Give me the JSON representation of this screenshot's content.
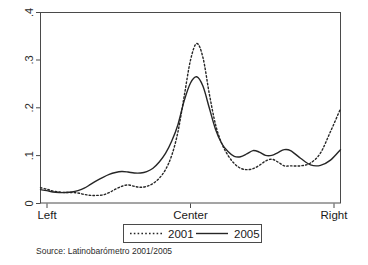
{
  "chart_data": {
    "type": "line",
    "title": "",
    "subtitle": "",
    "xlabel": "",
    "ylabel": "",
    "xlim": [
      0,
      10
    ],
    "ylim": [
      0,
      0.4
    ],
    "grid": false,
    "legend_position": "below-axis",
    "x_tick_labels": [
      "Left",
      "Center",
      "Right"
    ],
    "x_tick_values": [
      0,
      5,
      10
    ],
    "y_tick_labels": [
      "0",
      ".1",
      ".2",
      ".3",
      ".4"
    ],
    "y_tick_values": [
      0,
      0.1,
      0.2,
      0.3,
      0.4
    ],
    "x": [
      0,
      0.25,
      0.5,
      0.75,
      1.0,
      1.25,
      1.5,
      1.75,
      2.0,
      2.25,
      2.5,
      2.75,
      3.0,
      3.25,
      3.5,
      3.75,
      4.0,
      4.25,
      4.5,
      4.75,
      5.0,
      5.25,
      5.5,
      5.75,
      6.0,
      6.25,
      6.5,
      6.75,
      7.0,
      7.25,
      7.5,
      7.75,
      8.0,
      8.25,
      8.5,
      8.75,
      9.0,
      9.25,
      9.5,
      9.75,
      10.0
    ],
    "series": [
      {
        "name": "2001",
        "style": "dotted",
        "values": [
          0.032,
          0.029,
          0.025,
          0.023,
          0.022,
          0.022,
          0.021,
          0.018,
          0.016,
          0.016,
          0.017,
          0.022,
          0.029,
          0.035,
          0.038,
          0.035,
          0.033,
          0.035,
          0.041,
          0.052,
          0.07,
          0.1,
          0.15,
          0.225,
          0.3,
          0.335,
          0.305,
          0.23,
          0.165,
          0.125,
          0.1,
          0.083,
          0.073,
          0.07,
          0.072,
          0.079,
          0.088,
          0.092,
          0.086,
          0.078,
          0.078
        ]
      },
      {
        "name": "2005",
        "style": "solid",
        "values": [
          0.028,
          0.026,
          0.023,
          0.022,
          0.022,
          0.023,
          0.026,
          0.031,
          0.039,
          0.047,
          0.054,
          0.06,
          0.064,
          0.066,
          0.065,
          0.063,
          0.063,
          0.066,
          0.073,
          0.086,
          0.104,
          0.13,
          0.165,
          0.215,
          0.252,
          0.265,
          0.245,
          0.2,
          0.155,
          0.125,
          0.108,
          0.098,
          0.097,
          0.103,
          0.11,
          0.107,
          0.1,
          0.1,
          0.106,
          0.112,
          0.11
        ]
      }
    ],
    "series_tail_x": [
      10.0,
      10.4,
      10.8,
      11.2,
      11.6,
      12.0
    ],
    "series_tail": [
      {
        "name": "2001",
        "values": [
          0.078,
          0.078,
          0.084,
          0.105,
          0.15,
          0.198
        ]
      },
      {
        "name": "2005",
        "values": [
          0.11,
          0.094,
          0.08,
          0.079,
          0.09,
          0.112
        ]
      }
    ]
  },
  "axis": {
    "y_labels": [
      "0",
      ".1",
      ".2",
      ".3",
      ".4"
    ],
    "x_labels": {
      "left": "Left",
      "center": "Center",
      "right": "Right"
    }
  },
  "legend": {
    "entries": [
      {
        "label": "2001",
        "style": "dotted"
      },
      {
        "label": "2005",
        "style": "solid"
      }
    ]
  },
  "footer": {
    "source": "Source: Latinobarómetro 2001/2005"
  },
  "colors": {
    "line": "#262626",
    "axis": "#4a4a4a",
    "background": "#ffffff"
  }
}
